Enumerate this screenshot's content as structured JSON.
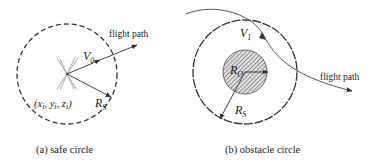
{
  "panel_a": {
    "caption": "(a) safe circle",
    "flight_path_label": "flight path",
    "velocity_label": "V",
    "velocity_sub": "0",
    "position_label": "(x",
    "position_i1": "i",
    "position_y": ", y",
    "position_i2": "i",
    "position_z": ", z",
    "position_i3": "i",
    "position_close": ")",
    "radius_label": "R",
    "radius_sub": "S"
  },
  "panel_b": {
    "caption": "(b) obstacle circle",
    "flight_path_label": "flight path",
    "velocity_label": "V",
    "velocity_sub": "1",
    "obstacle_radius_label": "R",
    "obstacle_radius_sub": "O",
    "safe_radius_label": "R",
    "safe_radius_sub": "S"
  },
  "colors": {
    "line": "#333333",
    "drone": "#b8b8b8",
    "hatch_bg": "#d9d9d9"
  }
}
